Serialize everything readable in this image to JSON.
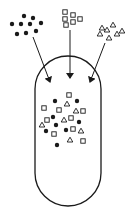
{
  "diagram": {
    "stroke_color": "#1a1a1a",
    "background": "#ffffff",
    "capsule": {
      "x": 35,
      "y": 56,
      "width": 66,
      "height": 150,
      "radius": 33
    },
    "groups": {
      "dots": [
        [
          24,
          16
        ],
        [
          33,
          18
        ],
        [
          12,
          24
        ],
        [
          21,
          24
        ],
        [
          30,
          24
        ],
        [
          41,
          23
        ],
        [
          17,
          34
        ],
        [
          26,
          33
        ],
        [
          36,
          31
        ]
      ],
      "squares": [
        [
          65,
          12
        ],
        [
          73,
          15
        ],
        [
          65,
          19
        ],
        [
          73,
          22
        ],
        [
          80,
          19
        ],
        [
          66,
          25
        ]
      ],
      "triangles": [
        [
          113,
          25
        ],
        [
          102,
          28
        ],
        [
          107,
          30
        ],
        [
          122,
          31
        ],
        [
          117,
          34
        ],
        [
          100,
          34
        ],
        [
          109,
          38
        ]
      ]
    },
    "arrows": [
      {
        "name": "dots-arrow",
        "from": [
          33,
          37
        ],
        "to": [
          50,
          82
        ]
      },
      {
        "name": "squares-arrow",
        "from": [
          70,
          30
        ],
        "to": [
          70,
          78
        ]
      },
      {
        "name": "triangles-arrow",
        "from": [
          105,
          43
        ],
        "to": [
          90,
          82
        ]
      }
    ],
    "mixture": [
      {
        "type": "square",
        "x": 69,
        "y": 95
      },
      {
        "type": "dot",
        "x": 55,
        "y": 101
      },
      {
        "type": "triangle",
        "x": 67,
        "y": 104
      },
      {
        "type": "dot",
        "x": 77,
        "y": 101
      },
      {
        "type": "square",
        "x": 44,
        "y": 108
      },
      {
        "type": "square",
        "x": 59,
        "y": 110
      },
      {
        "type": "triangle",
        "x": 76,
        "y": 111
      },
      {
        "type": "square",
        "x": 83,
        "y": 111
      },
      {
        "type": "dot",
        "x": 53,
        "y": 117
      },
      {
        "type": "square",
        "x": 47,
        "y": 120
      },
      {
        "type": "triangle",
        "x": 64,
        "y": 120
      },
      {
        "type": "square",
        "x": 71,
        "y": 118
      },
      {
        "type": "dot",
        "x": 79,
        "y": 122
      },
      {
        "type": "triangle",
        "x": 42,
        "y": 125
      },
      {
        "type": "dot",
        "x": 56,
        "y": 125
      },
      {
        "type": "dot",
        "x": 46,
        "y": 131
      },
      {
        "type": "dot",
        "x": 66,
        "y": 130
      },
      {
        "type": "square",
        "x": 73,
        "y": 129
      },
      {
        "type": "triangle",
        "x": 81,
        "y": 131
      },
      {
        "type": "square",
        "x": 54,
        "y": 134
      },
      {
        "type": "triangle",
        "x": 70,
        "y": 140
      },
      {
        "type": "square",
        "x": 83,
        "y": 141
      },
      {
        "type": "dot",
        "x": 57,
        "y": 145
      }
    ]
  }
}
